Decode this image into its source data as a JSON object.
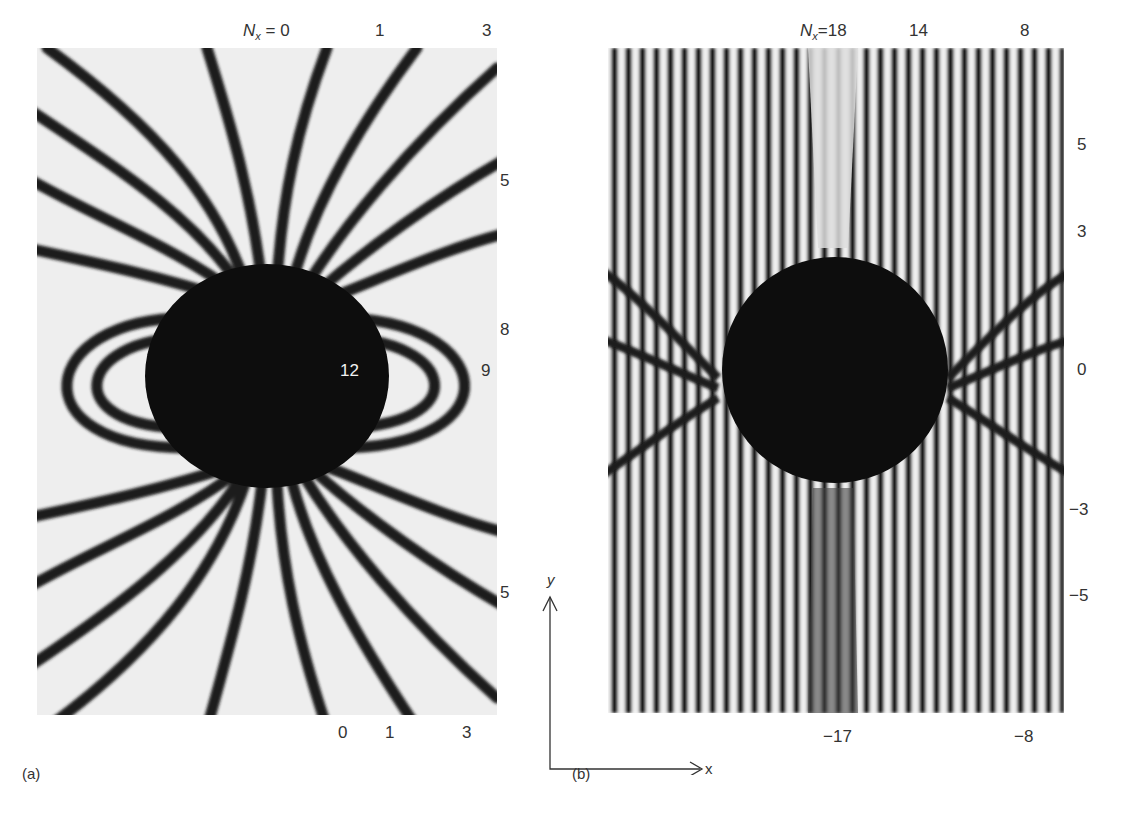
{
  "figure": {
    "panel_a": {
      "caption": "(a)",
      "top_labels": {
        "nx_prefix": "N",
        "nx_sub": "x",
        "nx_eq": " = ",
        "v0": "0",
        "v1": "1",
        "v3": "3"
      },
      "right_labels": {
        "r5_top": "5",
        "r8": "8",
        "r5_bottom": "5"
      },
      "inner_labels": {
        "n12": "12",
        "n9": "9"
      },
      "bottom_labels": {
        "b0": "0",
        "b1": "1",
        "b3": "3"
      }
    },
    "panel_b": {
      "caption": "(b)",
      "top_labels": {
        "nx_prefix": "N",
        "nx_sub": "x",
        "nx_eq": "=18",
        "v14": "14",
        "v8": "8"
      },
      "right_labels": {
        "r5": "5",
        "r3": "3",
        "r0": "0",
        "rm3": "−3",
        "rm5": "−5"
      },
      "bottom_labels": {
        "bm17": "−17",
        "bm8": "−8"
      }
    },
    "axes": {
      "y_label": "y",
      "x_label": "x"
    }
  }
}
